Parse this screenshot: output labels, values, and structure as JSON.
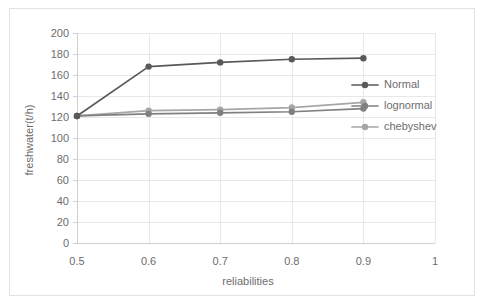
{
  "chart_data": {
    "type": "line",
    "title": "",
    "xlabel": "reliabilities",
    "ylabel": "freshwater(t/h)",
    "xlim": [
      0.5,
      1
    ],
    "ylim": [
      0,
      200
    ],
    "xticks": [
      "0.5",
      "0.6",
      "0.7",
      "0.8",
      "0.9",
      "1"
    ],
    "xtick_values": [
      0.5,
      0.6,
      0.7,
      0.8,
      0.9,
      1.0
    ],
    "yticks": [
      "0",
      "20",
      "40",
      "60",
      "80",
      "100",
      "120",
      "140",
      "160",
      "180",
      "200"
    ],
    "ytick_values": [
      0,
      20,
      40,
      60,
      80,
      100,
      120,
      140,
      160,
      180,
      200
    ],
    "grid": true,
    "grid_axis": "y",
    "legend_position": "right",
    "markers": "circle",
    "x": [
      0.5,
      0.6,
      0.7,
      0.8,
      0.9
    ],
    "series": [
      {
        "name": "Normal",
        "color": "#595959",
        "values": [
          121,
          168,
          172,
          175,
          176
        ]
      },
      {
        "name": "lognormal",
        "color": "#808080",
        "values": [
          121,
          123,
          124,
          125,
          128
        ]
      },
      {
        "name": "chebyshev",
        "color": "#a6a6a6",
        "values": [
          121,
          126,
          127,
          129,
          134
        ]
      }
    ]
  },
  "legend": {
    "items": [
      {
        "label": "Normal",
        "color": "#595959"
      },
      {
        "label": "lognormal",
        "color": "#808080"
      },
      {
        "label": "chebyshev",
        "color": "#a6a6a6"
      }
    ]
  },
  "colors": {
    "grid": "#e8e8e8",
    "axis": "#d0d0d0",
    "text": "#6d6d6d",
    "frame": "#e2e2e2",
    "background": "#ffffff"
  }
}
